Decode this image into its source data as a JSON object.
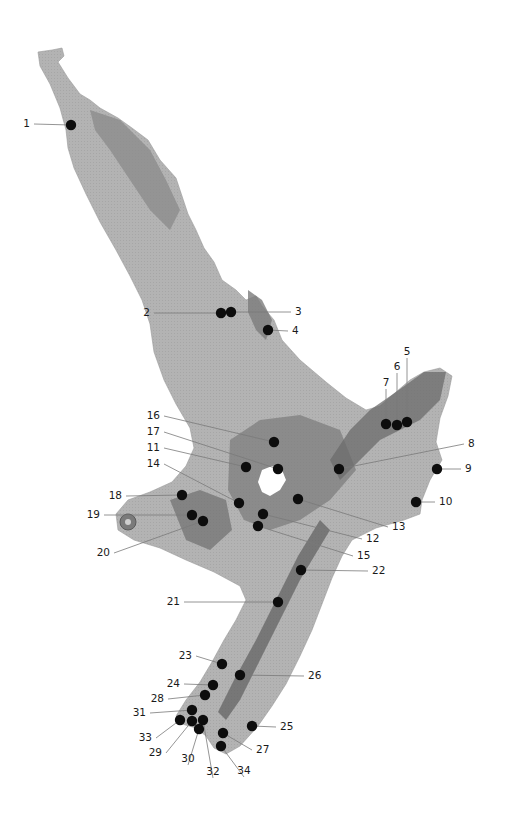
{
  "map": {
    "region": "North Island, New Zealand",
    "colors": {
      "background": "#ffffff",
      "land_light": "#b5b5b5",
      "land_mid": "#8f8f8f",
      "land_dark": "#6a6a6a",
      "lake": "#ffffff",
      "marker": "#0d0d0d",
      "leader": "#7a7a7a",
      "label": "#1a1a1a"
    },
    "markers": [
      {
        "id": "1",
        "label": "1",
        "x": 71,
        "y": 125,
        "lx": 30,
        "ly": 127,
        "anchor": "end"
      },
      {
        "id": "2",
        "label": "2",
        "x": 221,
        "y": 313,
        "lx": 150,
        "ly": 316,
        "anchor": "end"
      },
      {
        "id": "3",
        "label": "3",
        "x": 231,
        "y": 312,
        "lx": 295,
        "ly": 315,
        "anchor": "start"
      },
      {
        "id": "4",
        "label": "4",
        "x": 268,
        "y": 330,
        "lx": 292,
        "ly": 334,
        "anchor": "start"
      },
      {
        "id": "5",
        "label": "5",
        "x": 407,
        "y": 422,
        "lx": 407,
        "ly": 355,
        "anchor": "middle"
      },
      {
        "id": "6",
        "label": "6",
        "x": 397,
        "y": 425,
        "lx": 397,
        "ly": 370,
        "anchor": "middle"
      },
      {
        "id": "7",
        "label": "7",
        "x": 386,
        "y": 424,
        "lx": 386,
        "ly": 386,
        "anchor": "middle"
      },
      {
        "id": "8",
        "label": "8",
        "x": 339,
        "y": 469,
        "lx": 468,
        "ly": 447,
        "anchor": "start"
      },
      {
        "id": "9",
        "label": "9",
        "x": 437,
        "y": 469,
        "lx": 465,
        "ly": 472,
        "anchor": "start"
      },
      {
        "id": "10",
        "label": "10",
        "x": 416,
        "y": 502,
        "lx": 439,
        "ly": 505,
        "anchor": "start"
      },
      {
        "id": "11",
        "label": "11",
        "x": 246,
        "y": 467,
        "lx": 160,
        "ly": 451,
        "anchor": "end"
      },
      {
        "id": "12",
        "label": "12",
        "x": 263,
        "y": 514,
        "lx": 366,
        "ly": 542,
        "anchor": "start"
      },
      {
        "id": "13",
        "label": "13",
        "x": 298,
        "y": 499,
        "lx": 392,
        "ly": 530,
        "anchor": "start"
      },
      {
        "id": "14",
        "label": "14",
        "x": 239,
        "y": 503,
        "lx": 160,
        "ly": 467,
        "anchor": "end"
      },
      {
        "id": "15",
        "label": "15",
        "x": 258,
        "y": 526,
        "lx": 357,
        "ly": 559,
        "anchor": "start"
      },
      {
        "id": "16",
        "label": "16",
        "x": 274,
        "y": 442,
        "lx": 160,
        "ly": 419,
        "anchor": "end"
      },
      {
        "id": "17",
        "label": "17",
        "x": 278,
        "y": 469,
        "lx": 160,
        "ly": 435,
        "anchor": "end"
      },
      {
        "id": "18",
        "label": "18",
        "x": 182,
        "y": 495,
        "lx": 122,
        "ly": 499,
        "anchor": "end"
      },
      {
        "id": "19",
        "label": "19",
        "x": 192,
        "y": 515,
        "lx": 100,
        "ly": 518,
        "anchor": "end"
      },
      {
        "id": "20",
        "label": "20",
        "x": 203,
        "y": 521,
        "lx": 110,
        "ly": 556,
        "anchor": "end"
      },
      {
        "id": "21",
        "label": "21",
        "x": 278,
        "y": 602,
        "lx": 180,
        "ly": 605,
        "anchor": "end"
      },
      {
        "id": "22",
        "label": "22",
        "x": 301,
        "y": 570,
        "lx": 372,
        "ly": 574,
        "anchor": "start"
      },
      {
        "id": "23",
        "label": "23",
        "x": 222,
        "y": 664,
        "lx": 192,
        "ly": 659,
        "anchor": "end"
      },
      {
        "id": "24",
        "label": "24",
        "x": 213,
        "y": 685,
        "lx": 180,
        "ly": 687,
        "anchor": "end"
      },
      {
        "id": "25",
        "label": "25",
        "x": 252,
        "y": 726,
        "lx": 280,
        "ly": 730,
        "anchor": "start"
      },
      {
        "id": "26",
        "label": "26",
        "x": 240,
        "y": 675,
        "lx": 308,
        "ly": 679,
        "anchor": "start"
      },
      {
        "id": "27",
        "label": "27",
        "x": 223,
        "y": 733,
        "lx": 256,
        "ly": 753,
        "anchor": "start"
      },
      {
        "id": "28",
        "label": "28",
        "x": 205,
        "y": 695,
        "lx": 164,
        "ly": 702,
        "anchor": "end"
      },
      {
        "id": "29",
        "label": "29",
        "x": 192,
        "y": 721,
        "lx": 162,
        "ly": 756,
        "anchor": "end"
      },
      {
        "id": "30",
        "label": "30",
        "x": 199,
        "y": 729,
        "lx": 188,
        "ly": 762,
        "anchor": "middle"
      },
      {
        "id": "31",
        "label": "31",
        "x": 192,
        "y": 710,
        "lx": 146,
        "ly": 716,
        "anchor": "end"
      },
      {
        "id": "32",
        "label": "32",
        "x": 203,
        "y": 720,
        "lx": 213,
        "ly": 775,
        "anchor": "middle"
      },
      {
        "id": "33",
        "label": "33",
        "x": 180,
        "y": 720,
        "lx": 152,
        "ly": 741,
        "anchor": "end"
      },
      {
        "id": "34",
        "label": "34",
        "x": 221,
        "y": 746,
        "lx": 244,
        "ly": 774,
        "anchor": "middle"
      }
    ]
  }
}
